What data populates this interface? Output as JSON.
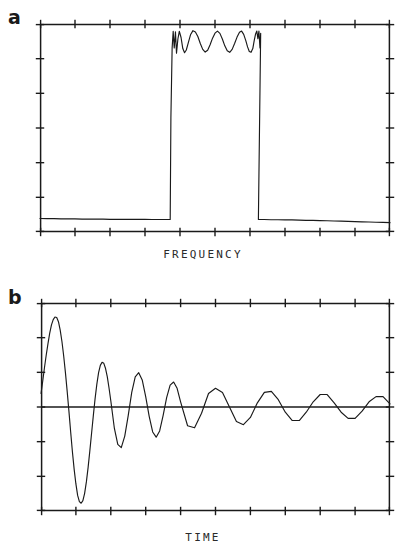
{
  "figure": {
    "background": "#ffffff",
    "ink_color": "#1a1a1a",
    "panels": [
      {
        "id": "a",
        "label": "a",
        "axis_caption": "FREQUENCY",
        "caption_axis": "x"
      },
      {
        "id": "b",
        "label": "b",
        "axis_caption": "TIME",
        "caption_axis": "x"
      }
    ]
  },
  "chart_data": [
    {
      "type": "line",
      "id": "panel-a",
      "title": "",
      "subtitle": "",
      "xlabel": "FREQUENCY",
      "ylabel": "",
      "legend": [],
      "grid": false,
      "frame": "box",
      "xlim": [
        0,
        1
      ],
      "ylim": [
        0,
        1
      ],
      "x_ticks": [
        0,
        0.1,
        0.2,
        0.3,
        0.4,
        0.5,
        0.6,
        0.7,
        0.8,
        0.9,
        1
      ],
      "y_ticks": [
        0,
        0.1667,
        0.3333,
        0.5,
        0.6667,
        0.8333,
        1
      ],
      "x_tick_labels": [],
      "y_tick_labels": [],
      "description": "Bandpass filter magnitude response with equiripple passband and low stopband",
      "passband_start": 0.372,
      "passband_end": 0.626,
      "stopband_level": 0.062,
      "passband_level": 0.885,
      "ripple_count": 4,
      "series": [
        {
          "name": "magnitude response",
          "x": [
            0.0,
            0.02,
            0.04,
            0.06,
            0.08,
            0.1,
            0.12,
            0.14,
            0.16,
            0.18,
            0.2,
            0.22,
            0.24,
            0.26,
            0.28,
            0.3,
            0.32,
            0.34,
            0.355,
            0.365,
            0.3695,
            0.372,
            0.374,
            0.3775,
            0.3805,
            0.3835,
            0.387,
            0.39,
            0.394,
            0.398,
            0.403,
            0.408,
            0.413,
            0.418,
            0.424,
            0.43,
            0.437,
            0.444,
            0.451,
            0.458,
            0.465,
            0.472,
            0.479,
            0.486,
            0.493,
            0.5,
            0.507,
            0.514,
            0.521,
            0.528,
            0.535,
            0.542,
            0.549,
            0.556,
            0.563,
            0.57,
            0.576,
            0.582,
            0.588,
            0.593,
            0.598,
            0.603,
            0.608,
            0.612,
            0.616,
            0.6195,
            0.6225,
            0.6255,
            0.6285,
            0.6305,
            0.624,
            0.6265,
            0.629,
            0.632,
            0.636,
            0.64,
            0.66,
            0.68,
            0.7,
            0.72,
            0.74,
            0.76,
            0.78,
            0.8,
            0.82,
            0.84,
            0.86,
            0.88,
            0.9,
            0.92,
            0.94,
            0.96,
            0.98,
            1.0
          ],
          "y": [
            0.065,
            0.064,
            0.064,
            0.063,
            0.063,
            0.063,
            0.062,
            0.062,
            0.062,
            0.062,
            0.061,
            0.061,
            0.061,
            0.061,
            0.061,
            0.061,
            0.06,
            0.06,
            0.06,
            0.06,
            0.06,
            0.06,
            0.55,
            0.885,
            0.965,
            0.885,
            0.962,
            0.86,
            0.928,
            0.965,
            0.935,
            0.882,
            0.862,
            0.875,
            0.912,
            0.948,
            0.968,
            0.962,
            0.94,
            0.906,
            0.878,
            0.865,
            0.874,
            0.9,
            0.932,
            0.956,
            0.966,
            0.955,
            0.928,
            0.895,
            0.871,
            0.864,
            0.878,
            0.906,
            0.937,
            0.96,
            0.966,
            0.95,
            0.92,
            0.89,
            0.868,
            0.864,
            0.882,
            0.92,
            0.952,
            0.966,
            0.93,
            0.966,
            0.885,
            0.955,
            0.06,
            0.06,
            0.06,
            0.06,
            0.06,
            0.06,
            0.059,
            0.059,
            0.058,
            0.058,
            0.057,
            0.056,
            0.056,
            0.055,
            0.054,
            0.053,
            0.052,
            0.051,
            0.05,
            0.049,
            0.048,
            0.047,
            0.046,
            0.045,
            0.044
          ]
        }
      ]
    },
    {
      "type": "line",
      "id": "panel-b",
      "title": "",
      "subtitle": "",
      "xlabel": "TIME",
      "ylabel": "",
      "legend": [],
      "grid": false,
      "frame": "box",
      "xlim": [
        0,
        1
      ],
      "ylim": [
        -1,
        1
      ],
      "x_ticks": [
        0,
        0.1,
        0.2,
        0.3,
        0.4,
        0.5,
        0.6,
        0.7,
        0.8,
        0.9,
        1
      ],
      "y_ticks": [
        -1,
        -0.6667,
        -0.3333,
        0,
        0.3333,
        0.6667,
        1
      ],
      "x_tick_labels": [],
      "y_tick_labels": [],
      "description": "Damped oscillatory impulse response decaying toward the zero baseline",
      "zero_line": 0.0,
      "oscillation_period": 0.0635,
      "initial_value": 0.13,
      "first_peak_value": 0.865,
      "first_trough_value": -0.925,
      "decay_constant": 3.35,
      "series": [
        {
          "name": "impulse response",
          "x": [
            0.0,
            0.005,
            0.01,
            0.015,
            0.02,
            0.025,
            0.03,
            0.035,
            0.04,
            0.045,
            0.05,
            0.055,
            0.06,
            0.065,
            0.07,
            0.075,
            0.08,
            0.085,
            0.09,
            0.095,
            0.1,
            0.105,
            0.11,
            0.115,
            0.12,
            0.125,
            0.13,
            0.135,
            0.14,
            0.145,
            0.15,
            0.155,
            0.16,
            0.165,
            0.17,
            0.175,
            0.18,
            0.185,
            0.19,
            0.195,
            0.2,
            0.21,
            0.22,
            0.23,
            0.24,
            0.25,
            0.26,
            0.27,
            0.28,
            0.29,
            0.3,
            0.31,
            0.32,
            0.33,
            0.34,
            0.35,
            0.36,
            0.37,
            0.38,
            0.39,
            0.4,
            0.42,
            0.44,
            0.46,
            0.48,
            0.5,
            0.52,
            0.54,
            0.56,
            0.58,
            0.6,
            0.62,
            0.64,
            0.66,
            0.68,
            0.7,
            0.72,
            0.74,
            0.76,
            0.78,
            0.8,
            0.82,
            0.84,
            0.86,
            0.88,
            0.9,
            0.92,
            0.94,
            0.96,
            0.98,
            1.0
          ],
          "y": [
            0.13,
            0.25,
            0.38,
            0.5,
            0.61,
            0.71,
            0.79,
            0.84,
            0.865,
            0.86,
            0.82,
            0.74,
            0.63,
            0.49,
            0.33,
            0.15,
            -0.04,
            -0.24,
            -0.43,
            -0.6,
            -0.74,
            -0.85,
            -0.91,
            -0.925,
            -0.9,
            -0.83,
            -0.72,
            -0.58,
            -0.42,
            -0.25,
            -0.08,
            0.08,
            0.22,
            0.33,
            0.4,
            0.43,
            0.42,
            0.37,
            0.29,
            0.18,
            0.06,
            -0.2,
            -0.36,
            -0.39,
            -0.28,
            -0.08,
            0.14,
            0.29,
            0.33,
            0.26,
            0.1,
            -0.09,
            -0.24,
            -0.29,
            -0.23,
            -0.08,
            0.09,
            0.21,
            0.24,
            0.18,
            0.05,
            -0.18,
            -0.2,
            -0.06,
            0.13,
            0.18,
            0.14,
            0.0,
            -0.14,
            -0.17,
            -0.1,
            0.04,
            0.14,
            0.15,
            0.07,
            -0.05,
            -0.13,
            -0.13,
            -0.05,
            0.05,
            0.12,
            0.12,
            0.04,
            -0.05,
            -0.11,
            -0.11,
            -0.04,
            0.05,
            0.1,
            0.1,
            0.03,
            -0.05
          ]
        }
      ]
    }
  ]
}
